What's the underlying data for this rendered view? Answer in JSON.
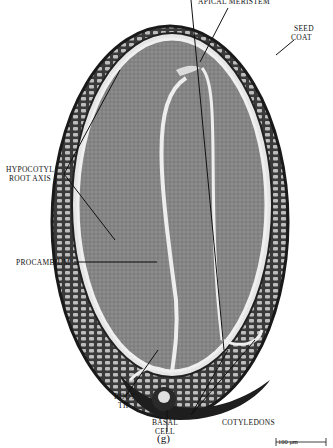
{
  "figure": {
    "panel_label": "(g)",
    "labels": {
      "apical_meristem": "APICAL MERISTEM",
      "seed_coat_1": "SEED",
      "seed_coat_2": "COAT",
      "hypocotyl_1": "HYPOCOTYL",
      "hypocotyl_2": "ROOT AXIS",
      "procambium": "PROCAMBIUM",
      "root_tip_1": "ROOT",
      "root_tip_2": "TIP",
      "basal_cell_1": "BASAL",
      "basal_cell_2": "CELL",
      "cotyledons": "COTYLEDONS"
    },
    "scale_bar": "100 μm",
    "colors": {
      "background": "#ffffff",
      "seed_coat": "#2a2a2a",
      "embryo_tissue": "#8a8a8a",
      "tissue_gap": "#e8e8e8",
      "ink": "#111111"
    }
  }
}
